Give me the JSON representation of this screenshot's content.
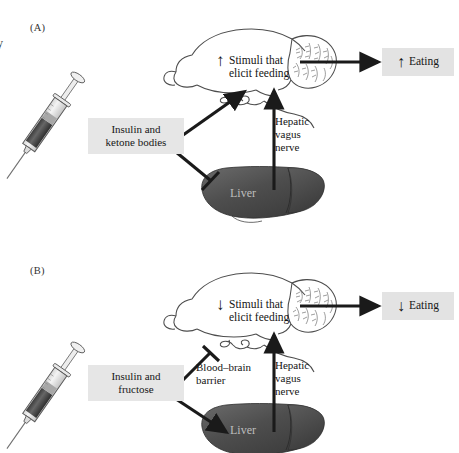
{
  "figure": {
    "cropped_left_caption": "y",
    "panels": [
      {
        "id": "A",
        "label": "(A)",
        "syringe_label": "Insulin and\nketone bodies",
        "syringe_label_line1": "Insulin and",
        "syringe_label_line2": "ketone bodies",
        "brain_label_line1": "Stimuli that",
        "brain_label_line2": "elicit feeding",
        "brain_arrow_direction": "up",
        "nerve_label_line1": "Hepatic",
        "nerve_label_line2": "vagus",
        "nerve_label_line3": "nerve",
        "organ_label": "Liver",
        "outcome_label": "Eating",
        "outcome_arrow_direction": "up",
        "connector_to_brain": "excitatory-arrow",
        "connector_to_liver": "inhibitory-bar",
        "vagus_connector": "excitatory-arrow-up",
        "barrier_label_line1": "",
        "barrier_label_line2": ""
      },
      {
        "id": "B",
        "label": "(B)",
        "syringe_label_line1": "Insulin and",
        "syringe_label_line2": "fructose",
        "brain_label_line1": "Stimuli that",
        "brain_label_line2": "elicit feeding",
        "brain_arrow_direction": "down",
        "nerve_label_line1": "Hepatic",
        "nerve_label_line2": "vagus",
        "nerve_label_line3": "nerve",
        "organ_label": "Liver",
        "outcome_label": "Eating",
        "outcome_arrow_direction": "down",
        "connector_to_brain": "inhibitory-bar",
        "connector_to_liver": "excitatory-arrow",
        "vagus_connector": "excitatory-arrow-up",
        "barrier_label_line1": "Blood–brain",
        "barrier_label_line2": "barrier"
      }
    ]
  },
  "glyphs": {
    "arrow_up": "↑",
    "arrow_down": "↓"
  },
  "colors": {
    "box_background": "#e6e6e6",
    "stroke": "#1a1a1a",
    "liver_dark": "#3f3f3f",
    "liver_mid": "#565656",
    "liver_light": "#6e6e6e",
    "liver_label_text": "#b9b9b9",
    "brain_outline": "#4a4a4a",
    "syringe_fluid_dark": "#4a4a4a",
    "syringe_fluid_light": "#9a9a9a",
    "page_background": "#ffffff"
  }
}
